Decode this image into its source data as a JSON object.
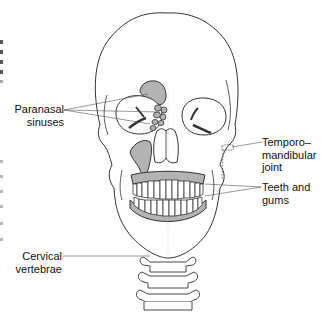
{
  "figure": {
    "colors": {
      "outline": "#333333",
      "bone_fill": "#ffffff",
      "highlight_fill": "#b3b3b3",
      "leader_line": "#555555",
      "text": "#111111"
    }
  },
  "labels": {
    "paranasal_sinuses": {
      "line1": "Paranasal",
      "line2": "sinuses"
    },
    "tmj": {
      "line1": "Temporo–",
      "line2": "mandibular",
      "line3": "joint"
    },
    "teeth_gums": {
      "line1": "Teeth and",
      "line2": "gums"
    },
    "cervical_vertebrae": {
      "line1": "Cervical",
      "line2": "vertebrae"
    }
  }
}
